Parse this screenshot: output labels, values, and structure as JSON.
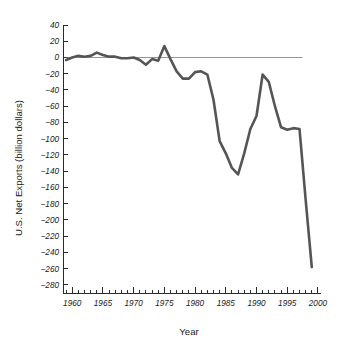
{
  "chart_data": {
    "type": "line",
    "title": "",
    "xlabel": "Year",
    "ylabel": "U.S. Net Exports (billion dollars)",
    "xlim": [
      1958.5,
      2000.5
    ],
    "ylim": [
      -290,
      40
    ],
    "grid": false,
    "legend": "none",
    "line_color": "#555555",
    "zero_reference_line": true,
    "x_major_ticks": [
      1960,
      1965,
      1970,
      1975,
      1980,
      1985,
      1990,
      1995,
      2000
    ],
    "x_tick_labels": [
      "1960",
      "1965",
      "1970",
      "1975",
      "1980",
      "1985",
      "1990",
      "1995",
      "2000"
    ],
    "x_minor_tick_interval": 1,
    "y_ticks": [
      40,
      20,
      0,
      -20,
      -40,
      -60,
      -80,
      -100,
      -120,
      -140,
      -160,
      -180,
      -200,
      -220,
      -240,
      -260,
      -280
    ],
    "y_tick_labels": [
      "40",
      "20",
      "0",
      "-20",
      "-40",
      "-60",
      "-80",
      "-100",
      "-120",
      "-140",
      "-160",
      "-180",
      "-200",
      "-220",
      "-240",
      "-260",
      "-280"
    ],
    "x": [
      1959,
      1960,
      1961,
      1962,
      1963,
      1964,
      1965,
      1966,
      1967,
      1968,
      1969,
      1970,
      1971,
      1972,
      1973,
      1974,
      1975,
      1976,
      1977,
      1978,
      1979,
      1980,
      1981,
      1982,
      1983,
      1984,
      1985,
      1986,
      1987,
      1988,
      1989,
      1990,
      1991,
      1992,
      1993,
      1994,
      1995,
      1996,
      1997,
      1998,
      1999
    ],
    "values": [
      -3,
      0,
      2,
      1,
      2,
      6,
      3,
      1,
      1,
      -1,
      -1,
      0,
      -3,
      -9,
      -2,
      -4,
      14,
      -2,
      -17,
      -26,
      -26,
      -18,
      -17,
      -21,
      -52,
      -103,
      -118,
      -136,
      -144,
      -118,
      -88,
      -72,
      -21,
      -30,
      -60,
      -86,
      -89,
      -87,
      -88,
      -175,
      -258
    ],
    "annotations": [],
    "notable_points": [
      {
        "year": 1964,
        "value": 6,
        "note": "early peak"
      },
      {
        "year": 1975,
        "value": 14,
        "note": "1975 surplus peak"
      },
      {
        "year": 1987,
        "value": -144,
        "note": "1987 trough"
      },
      {
        "year": 1991,
        "value": -21,
        "note": "1991 recovery peak"
      },
      {
        "year": 1999,
        "value": -258,
        "note": "final deficit"
      }
    ]
  }
}
